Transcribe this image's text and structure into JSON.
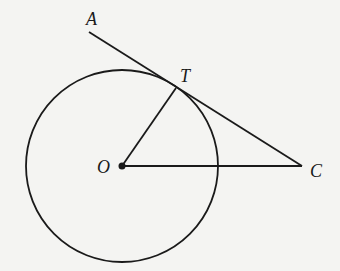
{
  "diagram": {
    "type": "geometry",
    "labels": {
      "A": "A",
      "T": "T",
      "O": "O",
      "C": "C"
    },
    "points": {
      "A": [
        89,
        32
      ],
      "T": [
        176,
        88
      ],
      "O": [
        122,
        166
      ],
      "C": [
        302,
        166
      ]
    },
    "circle": {
      "center": "O",
      "radius": 96
    },
    "segments": [
      {
        "from": "A",
        "to": "C",
        "name": "tangent-line"
      },
      {
        "from": "O",
        "to": "T",
        "name": "radius-OT"
      },
      {
        "from": "O",
        "to": "C",
        "name": "segment-OC"
      }
    ],
    "colors": {
      "stroke": "#1a1a1a",
      "background": "#f4f4f2"
    }
  }
}
